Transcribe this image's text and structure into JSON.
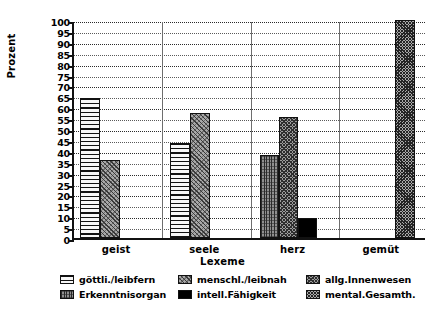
{
  "chart_data": {
    "type": "bar",
    "title": "",
    "xlabel": "Lexeme",
    "ylabel": "Prozent",
    "ylim": [
      0,
      100
    ],
    "ytick_step": 5,
    "grid": true,
    "legend_position": "bottom",
    "categories": [
      "geist",
      "seele",
      "herz",
      "gemüt"
    ],
    "ytick_labels": [
      "100",
      "95",
      "90",
      "85",
      "80",
      "75",
      "70",
      "65",
      "60",
      "55",
      "50",
      "45",
      "40",
      "35",
      "30",
      "25",
      "20",
      "15",
      "10",
      "5",
      "0"
    ],
    "series": [
      {
        "name": "göttli./leibfern",
        "pattern": "horizontal-lines",
        "values": [
          64,
          43.5,
          null,
          null
        ]
      },
      {
        "name": "menschl./leibnah",
        "pattern": "diagonal-hatch",
        "values": [
          36,
          57.5,
          null,
          null
        ]
      },
      {
        "name": "allg.Innenwesen",
        "pattern": "cross-hatch",
        "values": [
          null,
          null,
          55.5,
          null
        ]
      },
      {
        "name": "Erkenntnisorgan",
        "pattern": "vertical-texture",
        "values": [
          null,
          null,
          38,
          null
        ]
      },
      {
        "name": "intell.Fähigkeit",
        "pattern": "solid-black",
        "values": [
          null,
          null,
          9,
          null
        ]
      },
      {
        "name": "mental.Gesamth.",
        "pattern": "dense-dots",
        "values": [
          null,
          null,
          null,
          100
        ]
      }
    ],
    "bars": [
      {
        "category": "geist",
        "series": "göttli./leibfern",
        "value": 64,
        "pattern": "p-hline",
        "x": 6,
        "w": 20
      },
      {
        "category": "geist",
        "series": "menschl./leibnah",
        "value": 36,
        "pattern": "p-diag",
        "x": 26,
        "w": 20
      },
      {
        "category": "seele",
        "series": "göttli./leibfern",
        "value": 43.5,
        "pattern": "p-hline",
        "x": 96,
        "w": 20
      },
      {
        "category": "seele",
        "series": "menschl./leibnah",
        "value": 57.5,
        "pattern": "p-diag",
        "x": 116,
        "w": 20
      },
      {
        "category": "herz",
        "series": "Erkenntnisorgan",
        "value": 38,
        "pattern": "p-vert",
        "x": 186,
        "w": 19
      },
      {
        "category": "herz",
        "series": "allg.Innenwesen",
        "value": 55.5,
        "pattern": "p-cross",
        "x": 205,
        "w": 19
      },
      {
        "category": "herz",
        "series": "intell.Fähigkeit",
        "value": 9,
        "pattern": "p-solid",
        "x": 224,
        "w": 19
      },
      {
        "category": "gemüt",
        "series": "mental.Gesamth.",
        "value": 100,
        "pattern": "p-dots",
        "x": 321,
        "w": 20
      }
    ]
  },
  "axes": {
    "y_title": "Prozent",
    "x_title": "Lexeme"
  },
  "legend": {
    "items": [
      {
        "label": "göttli./leibfern",
        "swatch": "p-hline"
      },
      {
        "label": "menschl./leibnah",
        "swatch": "p-diag"
      },
      {
        "label": "allg.Innenwesen",
        "swatch": "p-cross"
      },
      {
        "label": "Erkenntnisorgan",
        "swatch": "p-vert"
      },
      {
        "label": "intell.Fähigkeit",
        "swatch": "p-solid"
      },
      {
        "label": "mental.Gesamth.",
        "swatch": "p-dots"
      }
    ]
  }
}
